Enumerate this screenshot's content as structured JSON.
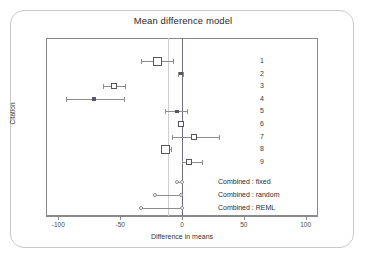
{
  "figure": {
    "title": "Mean difference model",
    "xlabel": "Difference in means",
    "ylabel": "Citation"
  },
  "axis": {
    "ticks": [
      {
        "value": -100,
        "label": "-100"
      },
      {
        "value": -50,
        "label": "-50"
      },
      {
        "value": 0,
        "label": "0"
      },
      {
        "value": 50,
        "label": "50"
      },
      {
        "value": 100,
        "label": "100"
      }
    ]
  },
  "reference_lines": {
    "zero_value": 0,
    "zero_color": "#6e6e8a",
    "summary_value": -11,
    "summary_color": "#cfcfcf"
  },
  "legend": {
    "study_labels": [
      "1",
      "2",
      "3",
      "4",
      "5",
      "6",
      "7",
      "8",
      "9"
    ],
    "combined_labels": [
      "Combined : fixed",
      "Combined : random",
      "Combined : REML"
    ]
  },
  "chart_data": {
    "type": "scatter",
    "title": "Mean difference model",
    "xlabel": "Difference in means",
    "ylabel": "Citation",
    "xlim": [
      -110,
      110
    ],
    "grid": false,
    "legend_position": "right-inside",
    "plot_kind": "forest-plot",
    "studies": [
      {
        "label": "1",
        "effect": -20,
        "ci_low": -33,
        "ci_high": -7,
        "marker": "square",
        "marker_size": "large",
        "filled": false
      },
      {
        "label": "2",
        "effect": -1,
        "ci_low": -3,
        "ci_high": 1,
        "marker": "square",
        "marker_size": "xsmall",
        "filled": true
      },
      {
        "label": "3",
        "effect": -55,
        "ci_low": -64,
        "ci_high": -46,
        "marker": "square",
        "marker_size": "small",
        "filled": false
      },
      {
        "label": "4",
        "effect": -71,
        "ci_low": -94,
        "ci_high": -47,
        "marker": "square",
        "marker_size": "xsmall",
        "filled": true
      },
      {
        "label": "5",
        "effect": -4,
        "ci_low": -14,
        "ci_high": 4,
        "marker": "square",
        "marker_size": "xsmall",
        "filled": true
      },
      {
        "label": "6",
        "effect": -1,
        "ci_low": -3,
        "ci_high": 1,
        "marker": "square",
        "marker_size": "small",
        "filled": false
      },
      {
        "label": "7",
        "effect": 10,
        "ci_low": -8,
        "ci_high": 30,
        "marker": "square",
        "marker_size": "small",
        "filled": false
      },
      {
        "label": "8",
        "effect": -13,
        "ci_low": -17,
        "ci_high": -9,
        "marker": "square",
        "marker_size": "large",
        "filled": false
      },
      {
        "label": "9",
        "effect": 6,
        "ci_low": 0,
        "ci_high": 16,
        "marker": "square",
        "marker_size": "small",
        "filled": false
      }
    ],
    "combined": [
      {
        "label": "Combined : fixed",
        "effect": -1.5,
        "ci_low": -4,
        "ci_high": 0,
        "marker": "circle"
      },
      {
        "label": "Combined : random",
        "effect": -9,
        "ci_low": -22,
        "ci_high": -1,
        "marker": "circle"
      },
      {
        "label": "Combined : REML",
        "effect": -16,
        "ci_low": -33,
        "ci_high": 0,
        "marker": "circle"
      }
    ]
  }
}
